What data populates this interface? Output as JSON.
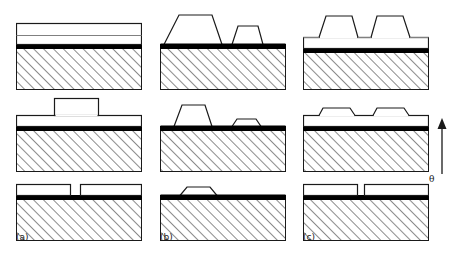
{
  "figure": {
    "type": "process-flow-cross-section-diagram",
    "columns": [
      {
        "label": "(a)",
        "steps": [
          {
            "row": "top",
            "name": "blanket-stack",
            "features": "continuous resist bilayer over black hard-mask on hatched substrate"
          },
          {
            "row": "middle",
            "name": "single-wide-block",
            "features": "one tall rectangular block centered on continuous resist layer"
          },
          {
            "row": "bottom",
            "name": "two-rectangles-with-gap",
            "features": "two flat rectangular pads separated by a narrow gap on black layer"
          }
        ]
      },
      {
        "label": "(b)",
        "steps": [
          {
            "row": "top",
            "name": "two-trapezoids-unequal",
            "features": "one tall wide trapezoid and one shorter narrow trapezoid on black layer"
          },
          {
            "row": "middle",
            "name": "two-trapezoids-reduced",
            "features": "medium trapezoid and very low flat trapezoid on black layer"
          },
          {
            "row": "bottom",
            "name": "single-low-trapezoid",
            "features": "one remaining low trapezoid on black layer"
          }
        ]
      },
      {
        "label": "(c)",
        "steps": [
          {
            "row": "top",
            "name": "two-equal-trapezoids-on-film",
            "features": "two identical trapezoids resting on a continuous resist film over black layer"
          },
          {
            "row": "middle",
            "name": "two-flattened-mounds",
            "features": "two low rounded mounds merged into the resist film over black layer"
          },
          {
            "row": "bottom",
            "name": "two-rectangles-with-gap",
            "features": "two flat rectangular pads separated by a narrow gap on black layer"
          }
        ]
      }
    ],
    "annotation": {
      "arrow_direction": "up",
      "arrow_label": "θ",
      "arrow_meaning": "increasing angle theta"
    },
    "colors": {
      "substrate_hatch": "#2b2b2b",
      "hard_mask": "#000000",
      "resist_fill": "#ffffff",
      "outline": "#1a1a1a",
      "inner_line": "#808080"
    }
  }
}
